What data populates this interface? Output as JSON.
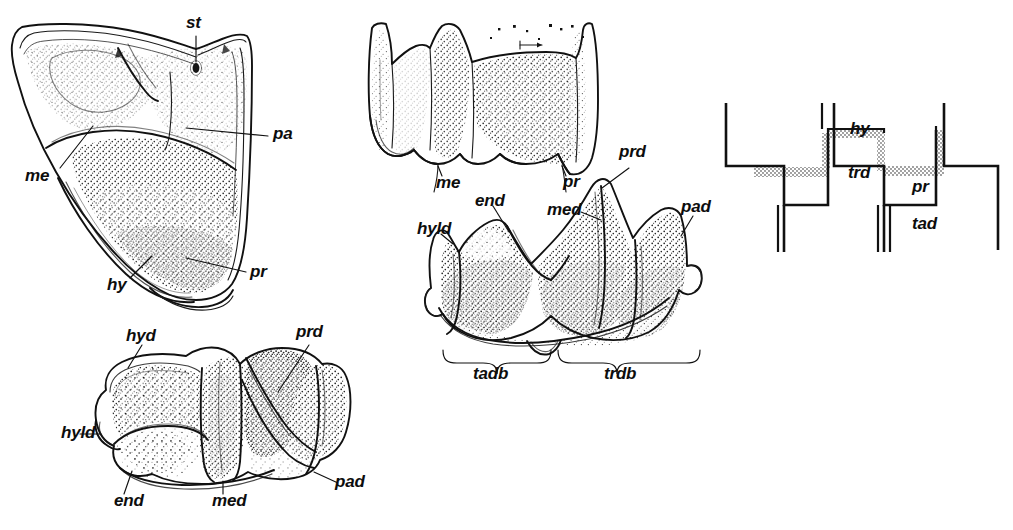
{
  "figure": {
    "background_color": "#ffffff",
    "ink_color": "#111111",
    "width": 1013,
    "height": 530
  },
  "panels": [
    {
      "id": "upper-molar-occlusal",
      "name": "upper molar, occlusal view",
      "labels": [
        {
          "key": "st",
          "text": "st",
          "x": 186,
          "y": 20,
          "desc": "stylar cusp"
        },
        {
          "key": "pa",
          "text": "pa",
          "x": 273,
          "y": 130,
          "desc": "paracone"
        },
        {
          "key": "me",
          "text": "me",
          "x": 25,
          "y": 172,
          "desc": "metacone"
        },
        {
          "key": "pr",
          "text": "pr",
          "x": 250,
          "y": 268,
          "desc": "protocone"
        },
        {
          "key": "hy",
          "text": "hy",
          "x": 107,
          "y": 281,
          "desc": "hypocone"
        }
      ]
    },
    {
      "id": "upper-molar-buccal",
      "name": "upper molar, buccal view",
      "labels": [
        {
          "key": "me",
          "text": "me",
          "x": 436,
          "y": 181,
          "desc": "metacone"
        },
        {
          "key": "pr",
          "text": "pr",
          "x": 563,
          "y": 180,
          "desc": "protocone"
        }
      ]
    },
    {
      "id": "lower-molar-lingual",
      "name": "lower molar, lingual view",
      "labels": [
        {
          "key": "prd",
          "text": "prd",
          "x": 620,
          "y": 148,
          "desc": "protoconid"
        },
        {
          "key": "pad",
          "text": "pad",
          "x": 681,
          "y": 203,
          "desc": "paraconid"
        },
        {
          "key": "med",
          "text": "med",
          "x": 554,
          "y": 207,
          "desc": "metaconid"
        },
        {
          "key": "end",
          "text": "end",
          "x": 478,
          "y": 198,
          "desc": "entoconid"
        },
        {
          "key": "hyld",
          "text": "hyld",
          "x": 422,
          "y": 226,
          "desc": "hypoconulid"
        }
      ],
      "brackets": [
        {
          "key": "tadb",
          "text": "tadb",
          "x": 475,
          "y": 369,
          "x1": 443,
          "x2": 562,
          "desc": "talonid basin"
        },
        {
          "key": "trdb",
          "text": "trdb",
          "x": 606,
          "y": 369,
          "x1": 570,
          "x2": 700,
          "desc": "trigonid basin"
        }
      ]
    },
    {
      "id": "lower-molar-occlusal",
      "name": "lower molar, occlusal view",
      "labels": [
        {
          "key": "hyd",
          "text": "hyd",
          "x": 126,
          "y": 332,
          "desc": "hypoconid"
        },
        {
          "key": "prd",
          "text": "prd",
          "x": 296,
          "y": 328,
          "desc": "protoconid"
        },
        {
          "key": "hyld",
          "text": "hyld",
          "x": 61,
          "y": 429,
          "desc": "hypoconulid"
        },
        {
          "key": "end",
          "text": "end",
          "x": 114,
          "y": 500,
          "desc": "entoconid"
        },
        {
          "key": "med",
          "text": "med",
          "x": 212,
          "y": 500,
          "desc": "metaconid"
        },
        {
          "key": "pad",
          "text": "pad",
          "x": 335,
          "y": 481,
          "desc": "paraconid"
        }
      ]
    },
    {
      "id": "occlusion-schematic",
      "name": "occlusal relationship schematic",
      "labels": [
        {
          "key": "hy",
          "text": "hy",
          "x": 853,
          "y": 128,
          "desc": "hypocone shear surface"
        },
        {
          "key": "trd",
          "text": "trd",
          "x": 851,
          "y": 172,
          "desc": "trigonid"
        },
        {
          "key": "pr",
          "text": "pr",
          "x": 915,
          "y": 186,
          "desc": "protocone shear surface"
        },
        {
          "key": "tad",
          "text": "tad",
          "x": 915,
          "y": 223,
          "desc": "talonid"
        }
      ]
    }
  ]
}
